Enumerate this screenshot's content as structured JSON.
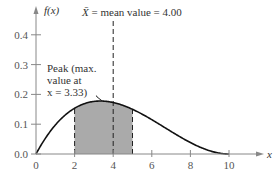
{
  "chart_data": {
    "type": "line",
    "title": "",
    "xlabel": "x",
    "ylabel": "f(x)",
    "xlim": [
      0,
      10
    ],
    "ylim": [
      0,
      0.4
    ],
    "x_ticks": [
      0,
      2,
      4,
      6,
      8,
      10
    ],
    "x_tick_labels": [
      "0",
      "2",
      "4",
      "6",
      "8",
      "10"
    ],
    "y_ticks": [
      0.0,
      0.1,
      0.2,
      0.3,
      0.4
    ],
    "y_tick_labels": [
      "0.0",
      "0.1",
      "0.2",
      "0.3",
      "0.4"
    ],
    "series": [
      {
        "name": "f(x)",
        "description": "Beta(2,3) density scaled to [0,10]",
        "x": [
          0,
          0.5,
          1,
          1.5,
          2,
          2.5,
          3,
          3.33,
          3.5,
          4,
          4.5,
          5,
          5.5,
          6,
          6.5,
          7,
          7.5,
          8,
          8.5,
          9,
          9.5,
          10
        ],
        "y": [
          0,
          0.0542,
          0.0972,
          0.1301,
          0.1536,
          0.1688,
          0.1764,
          0.1778,
          0.1775,
          0.1728,
          0.1634,
          0.15,
          0.1337,
          0.1152,
          0.0956,
          0.0756,
          0.0563,
          0.0384,
          0.023,
          0.0108,
          0.0029,
          0
        ]
      }
    ],
    "shaded_region": {
      "from": 2,
      "to": 5,
      "color": "#aaaaaa"
    },
    "reference_lines": [
      {
        "x": 4,
        "style": "dashed",
        "label": "mean"
      },
      {
        "x": 2,
        "style": "dashed"
      },
      {
        "x": 5,
        "style": "dashed"
      }
    ],
    "annotations": [
      {
        "text_parts": [
          "X̄",
          " = mean value = 4.00"
        ],
        "target_x": 4
      },
      {
        "lines": [
          "Peak (max.",
          "value at",
          "x = 3.33)"
        ],
        "target_x": 3.33,
        "target_y": 0.178
      }
    ],
    "grid": false,
    "legend": "none"
  }
}
